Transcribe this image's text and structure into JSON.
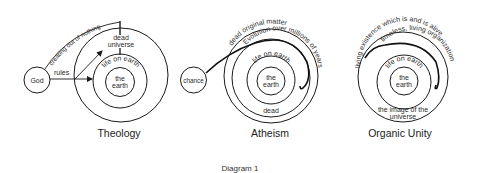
{
  "caption": "Diagram 1",
  "theology": {
    "title": "Theology",
    "source": "God",
    "rules_label": "rules",
    "creating_label": "creating out of nothing",
    "outer_line1": "dead",
    "outer_line2": "universe",
    "middle_label": "life on earth",
    "inner_line1": "the",
    "inner_line2": "earth"
  },
  "atheism": {
    "title": "Atheism",
    "source": "chance",
    "outer_label": "dead original matter",
    "evolution_label": "Evolution over millions of years",
    "middle_label": "life on earth",
    "dead_label": "dead",
    "inner_line1": "the",
    "inner_line2": "earth"
  },
  "organic_unity": {
    "title": "Organic Unity",
    "outer_label": "living existence which is and is alive",
    "organization_label": "timeless, living organization",
    "middle_label": "life on earth",
    "image_line1": "the image of the",
    "image_line2": "universe",
    "inner_line1": "the",
    "inner_line2": "earth"
  },
  "colors": {
    "stroke": "#1a1a1a",
    "text": "#2a2a2a",
    "background": "#ffffff"
  }
}
